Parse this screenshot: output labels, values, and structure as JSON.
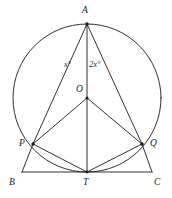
{
  "figure": {
    "background_color": "#ffffff",
    "stroke_color": "#1a1a1a",
    "label_color": "#1a1a1a"
  },
  "points": {
    "A": {
      "label": "A",
      "x": 87,
      "y": 24,
      "label_x": 82,
      "label_y": 6
    },
    "O": {
      "label": "O",
      "x": 87,
      "y": 98,
      "label_x": 76,
      "label_y": 85
    },
    "P": {
      "label": "P",
      "x": 33,
      "y": 144,
      "label_x": 19,
      "label_y": 139
    },
    "Q": {
      "label": "Q",
      "x": 142,
      "y": 144,
      "label_x": 150,
      "label_y": 139
    },
    "T": {
      "label": "T",
      "x": 87,
      "y": 172,
      "label_x": 83,
      "label_y": 178
    },
    "B": {
      "label": "B",
      "x": 22,
      "y": 172,
      "label_x": 9,
      "label_y": 178
    },
    "C": {
      "label": "C",
      "x": 152,
      "y": 172,
      "label_x": 154,
      "label_y": 178
    }
  },
  "circle": {
    "center_x": 87,
    "center_y": 98,
    "radius": 74
  },
  "angles": {
    "left": {
      "text": "x°",
      "x": 64,
      "y": 60
    },
    "right": {
      "text": "2x°",
      "x": 89,
      "y": 60
    }
  },
  "segments": [
    {
      "name": "A-P",
      "x1": 87,
      "y1": 24,
      "x2": 33,
      "y2": 144
    },
    {
      "name": "A-T",
      "x1": 87,
      "y1": 24,
      "x2": 87,
      "y2": 172
    },
    {
      "name": "A-Q",
      "x1": 87,
      "y1": 24,
      "x2": 142,
      "y2": 144
    },
    {
      "name": "O-P",
      "x1": 87,
      "y1": 98,
      "x2": 33,
      "y2": 144
    },
    {
      "name": "O-Q",
      "x1": 87,
      "y1": 98,
      "x2": 142,
      "y2": 144
    },
    {
      "name": "P-T",
      "x1": 33,
      "y1": 144,
      "x2": 87,
      "y2": 172
    },
    {
      "name": "Q-T",
      "x1": 142,
      "y1": 144,
      "x2": 87,
      "y2": 172
    },
    {
      "name": "P-B",
      "x1": 33,
      "y1": 144,
      "x2": 22,
      "y2": 172
    },
    {
      "name": "Q-C",
      "x1": 142,
      "y1": 144,
      "x2": 152,
      "y2": 172
    },
    {
      "name": "B-C",
      "x1": 22,
      "y1": 172,
      "x2": 152,
      "y2": 172
    }
  ]
}
